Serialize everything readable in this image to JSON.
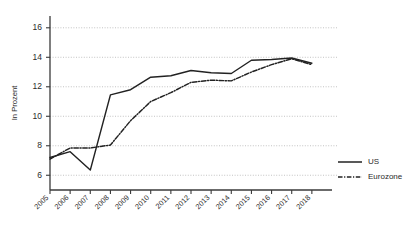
{
  "chart_data": {
    "type": "line",
    "title": "",
    "xlabel": "",
    "ylabel": "In Prozent",
    "ylim": [
      5.0,
      16.8
    ],
    "yticks": [
      6,
      8,
      10,
      12,
      14,
      16
    ],
    "grid": true,
    "legend_position": "right",
    "categories": [
      "2005",
      "2006",
      "2007",
      "2008",
      "2009",
      "2010",
      "2011",
      "2012",
      "2013",
      "2014",
      "2015",
      "2016",
      "2017",
      "2018"
    ],
    "series": [
      {
        "name": "US",
        "style": "solid",
        "color": "#222222",
        "values": [
          7.2,
          7.6,
          6.35,
          11.45,
          11.8,
          12.65,
          12.75,
          13.1,
          12.95,
          12.9,
          13.8,
          13.85,
          13.95,
          13.6
        ]
      },
      {
        "name": "Eurozone",
        "style": "dash-dot",
        "color": "#222222",
        "values": [
          7.1,
          7.85,
          7.85,
          8.05,
          9.7,
          11.0,
          11.6,
          12.3,
          12.45,
          12.4,
          13.0,
          13.5,
          13.9,
          13.5
        ]
      }
    ]
  },
  "axis": {
    "y_title": "In Prozent",
    "y_tick_labels": [
      "6",
      "8",
      "10",
      "12",
      "14",
      "16"
    ],
    "x_tick_labels": [
      "2005",
      "2006",
      "2007",
      "2008",
      "2009",
      "2010",
      "2011",
      "2012",
      "2013",
      "2014",
      "2015",
      "2016",
      "2017",
      "2018"
    ]
  },
  "legend": {
    "entries": [
      {
        "label": "US"
      },
      {
        "label": "Eurozone"
      }
    ]
  }
}
